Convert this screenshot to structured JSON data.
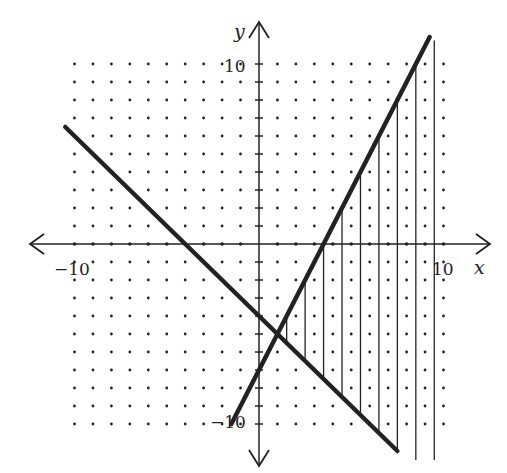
{
  "chart_data": {
    "type": "line",
    "title": "",
    "xlabel": "x",
    "ylabel": "y",
    "xlim": [
      -10,
      10
    ],
    "ylim": [
      -10,
      10
    ],
    "grid": "dotted, 1 unit spacing",
    "tick_labels": {
      "x": [
        "-10",
        "10"
      ],
      "y": [
        "10",
        "-10"
      ]
    },
    "series": [
      {
        "name": "line-descending",
        "equation": "y = -x - 4",
        "x": [
          -10.5,
          7.5
        ],
        "y": [
          6.5,
          -11.5
        ]
      },
      {
        "name": "line-steep",
        "equation": "y = 2x - 7",
        "x": [
          -1.5,
          9.25
        ],
        "y": [
          -10,
          11.5
        ]
      }
    ],
    "shaded_region": {
      "style": "vertical hatch lines",
      "description": "Region x >= 1 above y = -x - 4 and below y = 2x - 7",
      "hatch_x": [
        1.5,
        2.5,
        3.5,
        4.5,
        5.5,
        6.5,
        7.5,
        8.5,
        9.5
      ]
    },
    "intersection": {
      "x": 1,
      "y": -5
    }
  },
  "axes": {
    "x_label": "x",
    "y_label": "y",
    "x_min_label": "−10",
    "x_max_label": "10",
    "y_max_label": "10",
    "y_min_label": "−10"
  },
  "colors": {
    "ink": "#222222",
    "background": "#ffffff"
  }
}
